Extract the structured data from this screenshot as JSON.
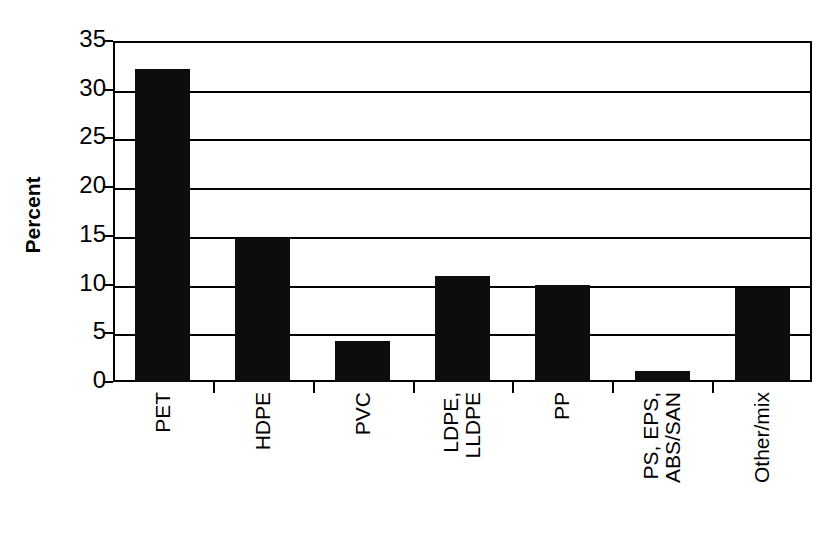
{
  "chart_data": {
    "type": "bar",
    "title": "",
    "subtitle": "",
    "xlabel": "",
    "ylabel": "Percent",
    "categories": [
      "PET",
      "HDPE",
      "PVC",
      "LDPE, LLDPE",
      "PP",
      "PS, EPS, ABS/SAN",
      "Other/mix"
    ],
    "category_lines": [
      [
        "PET"
      ],
      [
        "HDPE"
      ],
      [
        "PVC"
      ],
      [
        "LDPE,",
        "LLDPE"
      ],
      [
        "PP"
      ],
      [
        "PS, EPS,",
        "ABS/SAN"
      ],
      [
        "Other/mix"
      ]
    ],
    "values": [
      32.1,
      14.8,
      4.2,
      10.9,
      10.0,
      1.1,
      9.6
    ],
    "ylim": [
      0,
      35
    ],
    "yticks": [
      0,
      5,
      10,
      15,
      20,
      25,
      30,
      35
    ],
    "ytick_labels": [
      "0",
      "5",
      "10",
      "15",
      "20",
      "25",
      "30",
      "35"
    ],
    "grid": "horizontal",
    "legend": "none",
    "bar_color": "#0d0d0d",
    "axis_color": "#000000",
    "background_color": "#ffffff"
  }
}
